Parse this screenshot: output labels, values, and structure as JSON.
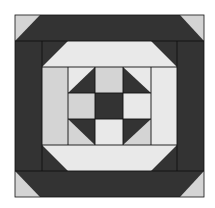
{
  "colors": {
    "background": "#ffffff",
    "dark": "#333333",
    "medium": "#d4d4d4",
    "light": "#e9e9e9",
    "line": "#111111"
  },
  "block": {
    "x": 15,
    "y": 15,
    "w": 189,
    "h": 182
  },
  "pieces": [
    {
      "name": "block-background-dark",
      "fill": "dark",
      "points": "15,15 204,15 204,197 15,197"
    },
    {
      "name": "corner-triangle-top-left",
      "fill": "medium",
      "points": "15,15 40,15 15,41"
    },
    {
      "name": "corner-triangle-top-right",
      "fill": "medium",
      "points": "180,15 204,15 204,41"
    },
    {
      "name": "corner-triangle-bottom-left",
      "fill": "medium",
      "points": "15,171 15,197 40,197"
    },
    {
      "name": "corner-triangle-bottom-right",
      "fill": "medium",
      "points": "204,171 204,197 180,197"
    },
    {
      "name": "light-frame-top",
      "fill": "light",
      "points": "68,41 151,41 177,67 42,67"
    },
    {
      "name": "light-frame-bottom",
      "fill": "light",
      "points": "42,145 177,145 151,171 68,171"
    },
    {
      "name": "light-frame-left",
      "fill": "medium",
      "points": "42,67 68,67 68,145 42,145"
    },
    {
      "name": "light-frame-right",
      "fill": "light",
      "points": "151,67 177,67 177,145 151,145"
    },
    {
      "name": "center-cell-top-left-bg",
      "fill": "light",
      "points": "68,67 95,67 95,93 68,93"
    },
    {
      "name": "center-cell-top-left-tri",
      "fill": "dark",
      "points": "95,67 95,93 68,93"
    },
    {
      "name": "center-cell-top-middle",
      "fill": "medium",
      "points": "95,67 123,67 123,93 95,93"
    },
    {
      "name": "center-cell-top-right-bg",
      "fill": "light",
      "points": "123,67 151,67 151,93 123,93"
    },
    {
      "name": "center-cell-top-right-tri",
      "fill": "dark",
      "points": "123,67 151,93 123,93"
    },
    {
      "name": "center-cell-middle-left",
      "fill": "medium",
      "points": "68,93 95,93 95,119 68,119"
    },
    {
      "name": "center-cell-center",
      "fill": "dark",
      "points": "95,93 123,93 123,119 95,119"
    },
    {
      "name": "center-cell-middle-right",
      "fill": "light",
      "points": "123,93 151,93 151,119 123,119"
    },
    {
      "name": "center-cell-bottom-left-bg",
      "fill": "medium",
      "points": "68,119 95,119 95,145 68,145"
    },
    {
      "name": "center-cell-bottom-left-tri",
      "fill": "dark",
      "points": "68,119 95,119 95,145"
    },
    {
      "name": "center-cell-bottom-middle",
      "fill": "light",
      "points": "95,119 123,119 123,145 95,145"
    },
    {
      "name": "center-cell-bottom-right-bg",
      "fill": "medium",
      "points": "123,119 151,119 151,145 123,145"
    },
    {
      "name": "center-cell-bottom-right-tri",
      "fill": "dark",
      "points": "123,119 151,119 123,145"
    }
  ],
  "lines": [
    {
      "name": "seam-top-band",
      "x1": 15,
      "y1": 41,
      "x2": 204,
      "y2": 41
    },
    {
      "name": "seam-bottom-band",
      "x1": 15,
      "y1": 171,
      "x2": 204,
      "y2": 171
    },
    {
      "name": "seam-left-inner",
      "x1": 42,
      "y1": 41,
      "x2": 42,
      "y2": 171
    },
    {
      "name": "seam-right-inner",
      "x1": 177,
      "y1": 41,
      "x2": 177,
      "y2": 171
    },
    {
      "name": "seam-center-left",
      "x1": 68,
      "y1": 67,
      "x2": 68,
      "y2": 145
    },
    {
      "name": "seam-center-right",
      "x1": 151,
      "y1": 67,
      "x2": 151,
      "y2": 145
    },
    {
      "name": "seam-center-top",
      "x1": 42,
      "y1": 67,
      "x2": 177,
      "y2": 67
    },
    {
      "name": "seam-center-bottom",
      "x1": 42,
      "y1": 145,
      "x2": 177,
      "y2": 145
    },
    {
      "name": "seam-grid-v1",
      "x1": 95,
      "y1": 67,
      "x2": 95,
      "y2": 145
    },
    {
      "name": "seam-grid-v2",
      "x1": 123,
      "y1": 67,
      "x2": 123,
      "y2": 145
    },
    {
      "name": "seam-grid-h1",
      "x1": 68,
      "y1": 93,
      "x2": 151,
      "y2": 93
    },
    {
      "name": "seam-grid-h2",
      "x1": 68,
      "y1": 119,
      "x2": 151,
      "y2": 119
    }
  ]
}
